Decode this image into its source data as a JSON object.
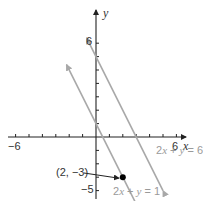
{
  "chart_data": {
    "type": "line",
    "title": "",
    "xlabel": "x",
    "ylabel": "y",
    "xlim": [
      -6,
      6
    ],
    "ylim": [
      -5,
      6
    ],
    "grid": false,
    "x_tick_labels": [
      "-6",
      "6"
    ],
    "y_tick_labels": [
      "6",
      "-5"
    ],
    "x_tick_labels_display": [
      "−6",
      "6"
    ],
    "y_tick_labels_display": [
      "6",
      "−5"
    ],
    "series": [
      {
        "name": "2x + y = 6",
        "label_display": "2x + y = 6",
        "equation": "y = -2x + 6",
        "slope": -2,
        "intercept": 6,
        "x": [
          -0.7,
          5.0
        ],
        "y": [
          7.4,
          -4.0
        ],
        "color": "#a8a8a8"
      },
      {
        "name": "2x + y = 1",
        "label_display": "2x + y = 1",
        "equation": "y = -2x + 1",
        "slope": -2,
        "intercept": 1,
        "x": [
          -2.2,
          3.1
        ],
        "y": [
          5.4,
          -5.2
        ],
        "color": "#a8a8a8"
      }
    ],
    "points": [
      {
        "label": "(2, −3)",
        "x": 2,
        "y": -3,
        "color": "#000000"
      }
    ],
    "annotations": [
      {
        "text": "(2, −3)",
        "points_to": [
          2,
          -3
        ]
      }
    ]
  },
  "labels": {
    "x_axis": "x",
    "y_axis": "y",
    "x_min": "−6",
    "x_max": "6",
    "y_max": "6",
    "y_min": "−5",
    "point": "(2, −3)",
    "line1_pre": "2",
    "line1_x": "x",
    "line1_mid": " + ",
    "line1_y": "y",
    "line1_post": " = 6",
    "line2_pre": "2",
    "line2_x": "x",
    "line2_mid": " + ",
    "line2_y": "y",
    "line2_post": " = 1"
  }
}
